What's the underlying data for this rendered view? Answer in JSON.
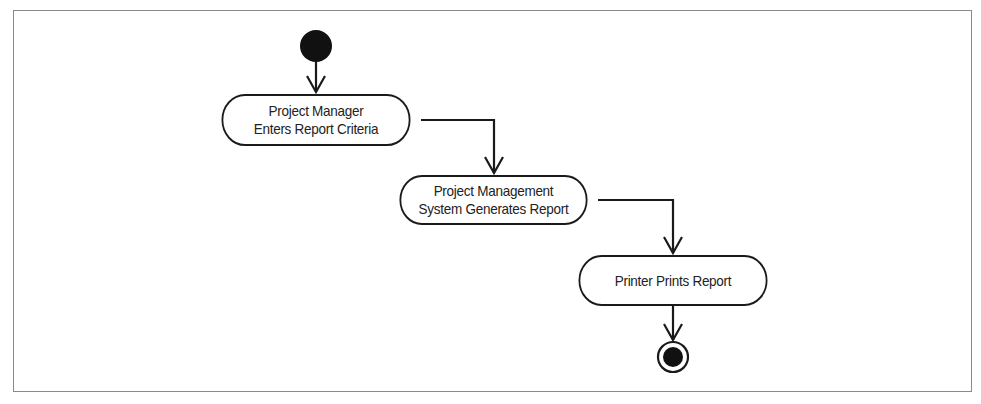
{
  "diagram": {
    "type": "uml-activity-diagram",
    "start_node": {
      "icon": "initial-node-filled-circle"
    },
    "activities": [
      {
        "line1": "Project Manager",
        "line2": "Enters Report Criteria"
      },
      {
        "line1": "Project Management",
        "line2": "System Generates Report"
      },
      {
        "line1": "Printer Prints Report",
        "line2": ""
      }
    ],
    "end_node": {
      "icon": "final-node-bullseye"
    },
    "edges": [
      {
        "from": "start",
        "to": "activity-1"
      },
      {
        "from": "activity-1",
        "to": "activity-2"
      },
      {
        "from": "activity-2",
        "to": "activity-3"
      },
      {
        "from": "activity-3",
        "to": "end"
      }
    ],
    "colors": {
      "stroke": "#1a1a1a",
      "frame": "#8a8a8a",
      "background": "#ffffff"
    }
  }
}
